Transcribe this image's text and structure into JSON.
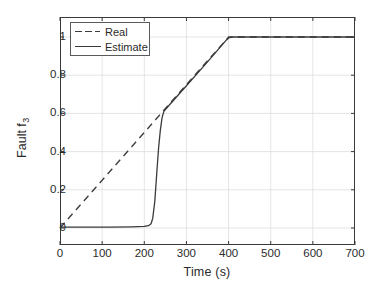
{
  "chart_data": {
    "type": "line",
    "title": "",
    "xlabel": "Time (s)",
    "ylabel": "Fault f",
    "ylabel_sub": "3",
    "xlim": [
      0,
      700
    ],
    "ylim": [
      0,
      1.08
    ],
    "xticks": [
      0,
      100,
      200,
      300,
      400,
      500,
      600,
      700
    ],
    "xticklabels": [
      "0",
      "100",
      "200",
      "300",
      "400",
      "500",
      "600",
      "700"
    ],
    "yticks": [
      0,
      0.2,
      0.4,
      0.6,
      0.8,
      1
    ],
    "yticklabels": [
      "0",
      "0.2",
      "0.4",
      "0.6",
      "0.8",
      "1"
    ],
    "grid": true,
    "legend_position": "upper left",
    "series": [
      {
        "name": "Real",
        "style": "dashed",
        "color": "#3a3a3a",
        "x": [
          0,
          400,
          700
        ],
        "y": [
          0,
          1,
          1
        ]
      },
      {
        "name": "Estimate",
        "style": "solid",
        "color": "#3a3a3a",
        "x": [
          0,
          60,
          120,
          170,
          200,
          210,
          216,
          220,
          225,
          230,
          234,
          238,
          242,
          245,
          247,
          260,
          300,
          350,
          395,
          402,
          410,
          450,
          500,
          550,
          600,
          650,
          700
        ],
        "y": [
          0.005,
          0.005,
          0.005,
          0.006,
          0.008,
          0.012,
          0.022,
          0.05,
          0.14,
          0.3,
          0.42,
          0.51,
          0.575,
          0.6,
          0.612,
          0.645,
          0.745,
          0.87,
          0.985,
          0.997,
          1.0,
          1.0,
          1.0,
          1.0,
          1.0,
          1.0,
          1.0
        ]
      }
    ]
  },
  "legend": {
    "items": [
      {
        "label": "Real",
        "style": "dashed"
      },
      {
        "label": "Estimate",
        "style": "solid"
      }
    ]
  },
  "colors": {
    "line": "#3a3a3a",
    "axis": "#3a3a3a",
    "grid": "#d8d8d8",
    "text": "#2b2b2b",
    "background": "#ffffff"
  }
}
